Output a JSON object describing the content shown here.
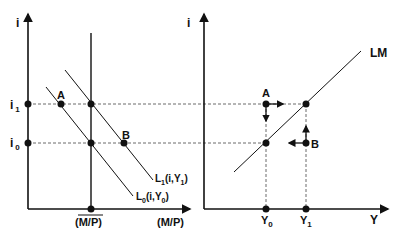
{
  "left_panel": {
    "y_axis_label": "i",
    "x_axis_label": "(M/P)",
    "i1_label": "i",
    "i1_sub": "1",
    "i0_label": "i",
    "i0_sub": "0",
    "supply_label": "(M/P)",
    "point_a": "A",
    "point_b": "B",
    "curve_l1": {
      "main": "L",
      "sub": "1",
      "args": "(i,Y",
      "argsub": "1",
      "close": ")"
    },
    "curve_l0": {
      "main": "L",
      "sub": "0",
      "args": "(i,Y",
      "argsub": "0",
      "close": ")"
    }
  },
  "right_panel": {
    "y_axis_label": "i",
    "x_axis_label": "Y",
    "curve_label": "LM",
    "y0_label": "Y",
    "y0_sub": "0",
    "y1_label": "Y",
    "y1_sub": "1",
    "point_a": "A",
    "point_b": "B"
  },
  "colors": {
    "line": "#111111",
    "dashed": "#444444"
  }
}
